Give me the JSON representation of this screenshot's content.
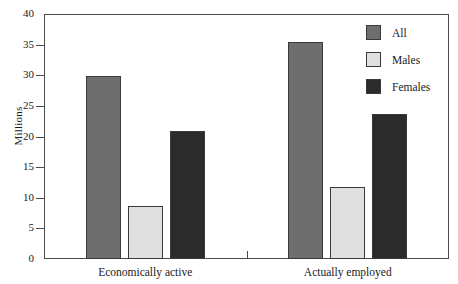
{
  "chart_data": {
    "type": "bar",
    "title": "",
    "subtitle": "",
    "xlabel": "",
    "ylabel": "Millions",
    "categories": [
      "Economically active",
      "Actually employed"
    ],
    "series": [
      {
        "name": "All",
        "values": [
          29.9,
          35.5
        ],
        "color": "#6e6e6e"
      },
      {
        "name": "Males",
        "values": [
          8.6,
          11.8
        ],
        "color": "#e0e0e0"
      },
      {
        "name": "Females",
        "values": [
          20.9,
          23.6
        ],
        "color": "#2b2b2b"
      }
    ],
    "ylim": [
      0,
      40
    ],
    "ytick_step": 5,
    "yticks": [
      "0",
      "5",
      "10",
      "15",
      "20",
      "25",
      "30",
      "35",
      "40"
    ],
    "grid": false,
    "legend_position": "top-right",
    "axis_color": "#4a4a4a",
    "background": "#ffffff"
  }
}
